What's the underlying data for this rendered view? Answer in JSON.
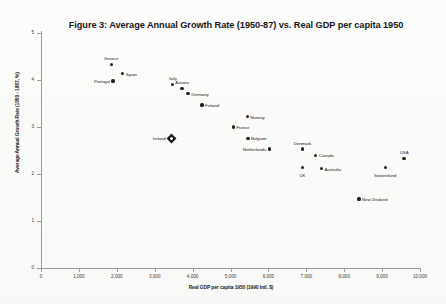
{
  "figure": {
    "title": "Figure 3: Average Annual Growth Rate (1950-87) vs. Real GDP per capita 1950",
    "background_color": "#fdfdfc",
    "marker_color": "#232327",
    "highlight_marker_color": "#1a1a1d"
  },
  "chart_data": {
    "type": "scatter",
    "title": "Figure 3: Average Annual Growth Rate (1950-87) vs. Real GDP per capita 1950",
    "xlabel": "Real GDP per capita 1950 (1990 Intl. $)",
    "ylabel": "Average Annual Growth Rate (1950 - 1987, %)",
    "xlim": [
      0,
      10000
    ],
    "ylim": [
      0,
      5
    ],
    "xticks": [
      0,
      1000,
      2000,
      3000,
      4000,
      5000,
      6000,
      7000,
      8000,
      9000,
      10000
    ],
    "xtick_labels": [
      "0",
      "1,000",
      "2,000",
      "3,000",
      "4,000",
      "5,000",
      "6,000",
      "7,000",
      "8,000",
      "9,000",
      "10,000"
    ],
    "yticks": [
      0,
      1,
      2,
      3,
      4,
      5
    ],
    "ytick_labels": [
      "0",
      "1",
      "2",
      "3",
      "4",
      "5"
    ],
    "grid": false,
    "legend": false,
    "points": [
      {
        "label": "Greece",
        "x": 1850,
        "y": 4.33,
        "label_pos": "top",
        "highlight": false
      },
      {
        "label": "Spain",
        "x": 2160,
        "y": 4.13,
        "label_pos": "right",
        "highlight": false
      },
      {
        "label": "Portugal",
        "x": 1900,
        "y": 3.98,
        "label_pos": "left",
        "highlight": false
      },
      {
        "label": "Italy",
        "x": 3480,
        "y": 3.91,
        "label_pos": "top",
        "highlight": false
      },
      {
        "label": "Austria",
        "x": 3720,
        "y": 3.82,
        "label_pos": "top",
        "highlight": false
      },
      {
        "label": "Germany",
        "x": 3880,
        "y": 3.71,
        "label_pos": "right",
        "highlight": false
      },
      {
        "label": "Finland",
        "x": 4250,
        "y": 3.47,
        "label_pos": "right",
        "highlight": false
      },
      {
        "label": "Norway",
        "x": 5440,
        "y": 3.22,
        "label_pos": "right",
        "highlight": false
      },
      {
        "label": "France",
        "x": 5070,
        "y": 3.0,
        "label_pos": "right",
        "highlight": false
      },
      {
        "label": "Belgium",
        "x": 5460,
        "y": 2.76,
        "label_pos": "right",
        "highlight": false
      },
      {
        "label": "Netherlands",
        "x": 6020,
        "y": 2.53,
        "label_pos": "left",
        "highlight": false
      },
      {
        "label": "Ireland",
        "x": 3450,
        "y": 2.76,
        "label_pos": "left",
        "highlight": true
      },
      {
        "label": "Denmark",
        "x": 6900,
        "y": 2.53,
        "label_pos": "top",
        "highlight": false
      },
      {
        "label": "Canada",
        "x": 7250,
        "y": 2.4,
        "label_pos": "right",
        "highlight": false
      },
      {
        "label": "UK",
        "x": 6900,
        "y": 2.13,
        "label_pos": "bottom",
        "highlight": false
      },
      {
        "label": "Australia",
        "x": 7400,
        "y": 2.11,
        "label_pos": "right",
        "highlight": false
      },
      {
        "label": "Switzerland",
        "x": 9080,
        "y": 2.13,
        "label_pos": "bottom",
        "highlight": false
      },
      {
        "label": "USA",
        "x": 9580,
        "y": 2.33,
        "label_pos": "top",
        "highlight": false
      },
      {
        "label": "New Zealand",
        "x": 8390,
        "y": 1.47,
        "label_pos": "right",
        "highlight": false
      }
    ]
  }
}
